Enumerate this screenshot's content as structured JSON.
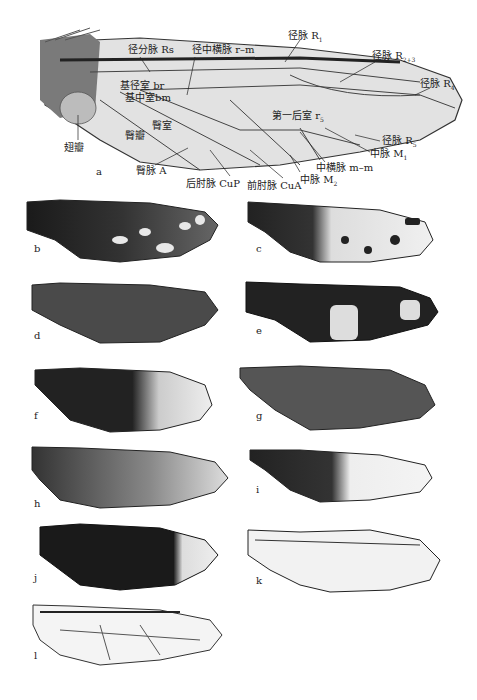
{
  "figure": {
    "main_panel": {
      "letter": "a",
      "labels": {
        "rs": {
          "text": "径分脉 Rs"
        },
        "rm": {
          "text": "径中横脉 r–m"
        },
        "r1": {
          "text": "径脉 R",
          "sub": "1"
        },
        "r23": {
          "text": "径脉 R",
          "sub": "2+3"
        },
        "r4": {
          "text": "径脉 R",
          "sub": "4"
        },
        "br": {
          "text": "基径室 br"
        },
        "bm": {
          "text": "基中室bm"
        },
        "jugum": {
          "text": "翅瓣"
        },
        "anal_lobe": {
          "text": "臀瓣"
        },
        "anal_cell": {
          "text": "臀室"
        },
        "anal_vein": {
          "text": "臀脉 A"
        },
        "cup": {
          "text": "后肘脉 CuP"
        },
        "cua": {
          "text": "前肘脉 CuA"
        },
        "r5cell": {
          "text": "第一后室 r",
          "sub": "5"
        },
        "r5": {
          "text": "径脉 R",
          "sub": "5"
        },
        "m1": {
          "text": "中脉 M",
          "sub": "1"
        },
        "mm": {
          "text": "中横脉 m–m"
        },
        "m2": {
          "text": "中脉 M",
          "sub": "2"
        }
      }
    },
    "panels": [
      {
        "letter": "b",
        "pattern": "dark-with-pale-spots"
      },
      {
        "letter": "c",
        "pattern": "dark-base-clear-apex-spots"
      },
      {
        "letter": "d",
        "pattern": "uniform-dark"
      },
      {
        "letter": "e",
        "pattern": "dark-marbled"
      },
      {
        "letter": "f",
        "pattern": "dark-base-clear-tip"
      },
      {
        "letter": "g",
        "pattern": "smoky-streaked"
      },
      {
        "letter": "h",
        "pattern": "graded-dark-to-clear"
      },
      {
        "letter": "i",
        "pattern": "dark-base-clear-apex"
      },
      {
        "letter": "j",
        "pattern": "black-with-clear-tip"
      },
      {
        "letter": "k",
        "pattern": "clear-veined"
      },
      {
        "letter": "l",
        "pattern": "clear-veined"
      }
    ],
    "colors": {
      "dark_wing": "#1e1e1e",
      "mid_wing": "#555555",
      "clear_wing": "#eeeeee",
      "vein": "#333333"
    }
  }
}
